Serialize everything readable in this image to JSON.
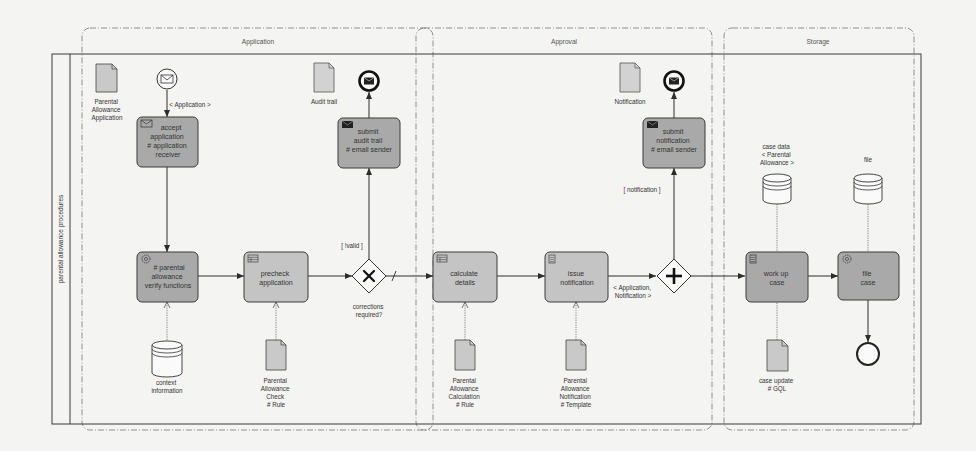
{
  "pool": {
    "label": "parental allowance procedures"
  },
  "groups": [
    {
      "id": "application",
      "label": "Application"
    },
    {
      "id": "approval",
      "label": "Approval"
    },
    {
      "id": "storage",
      "label": "Storage"
    }
  ],
  "events": {
    "start_message": {
      "label": "< Application >"
    },
    "end_audit": {
      "type": "message-end"
    },
    "end_notification": {
      "type": "message-end"
    },
    "end_file": {
      "type": "end"
    }
  },
  "tasks": {
    "accept_application": {
      "lines": [
        "accept",
        "application",
        "# application",
        "receiver"
      ],
      "icon": "envelope-icon",
      "shade": "dark"
    },
    "verify_functions": {
      "lines": [
        "# parental",
        "allowance",
        "verify functions"
      ],
      "icon": "gear-icon",
      "shade": "dark"
    },
    "precheck_application": {
      "lines": [
        "precheck",
        "application"
      ],
      "icon": "table-icon",
      "shade": "light"
    },
    "submit_audit_trail": {
      "lines": [
        "submit",
        "audit trail",
        "# email sender"
      ],
      "icon": "envelope-filled-icon",
      "shade": "dark"
    },
    "calculate_details": {
      "lines": [
        "calculate",
        "details"
      ],
      "icon": "table-icon",
      "shade": "light"
    },
    "issue_notification": {
      "lines": [
        "issue",
        "notification"
      ],
      "icon": "script-icon",
      "shade": "light"
    },
    "submit_notification": {
      "lines": [
        "submit",
        "notification",
        "# email sender"
      ],
      "icon": "envelope-filled-icon",
      "shade": "dark"
    },
    "work_up_case": {
      "lines": [
        "work up",
        "case"
      ],
      "icon": "script-icon",
      "shade": "dark"
    },
    "file_case": {
      "lines": [
        "file",
        "case"
      ],
      "icon": "gear-icon",
      "shade": "dark"
    }
  },
  "gateways": {
    "corrections": {
      "type": "exclusive",
      "label": "corrections required?",
      "lines": [
        "corrections",
        "required?"
      ]
    },
    "parallel": {
      "type": "parallel"
    }
  },
  "data_objects": {
    "parental_allowance_application": {
      "lines": [
        "Parental",
        "Allowance",
        "Application"
      ]
    },
    "audit_trail": {
      "lines": [
        "Audit trail"
      ]
    },
    "notification": {
      "lines": [
        "Notification"
      ]
    },
    "pa_check_rule": {
      "lines": [
        "Parental",
        "Allowance",
        "Check",
        "# Rule"
      ]
    },
    "pa_calc_rule": {
      "lines": [
        "Parental",
        "Allowance",
        "Calculation",
        "# Rule"
      ]
    },
    "pa_notif_template": {
      "lines": [
        "Parental",
        "Allowance",
        "Notification",
        "# Template"
      ]
    },
    "case_update": {
      "lines": [
        "case update",
        "# GQL"
      ]
    }
  },
  "data_stores": {
    "context_information": {
      "lines": [
        "context",
        "information"
      ]
    },
    "case_data": {
      "lines": [
        "case data",
        "< Parental",
        "Allowance >"
      ]
    },
    "file": {
      "lines": [
        "file"
      ]
    }
  },
  "flow_labels": {
    "invalid": "[ !valid ]",
    "notification": "[ notification ]",
    "application_notification": [
      "< Application,",
      "Notification >"
    ]
  },
  "colors": {
    "background": "#f4f4f2",
    "task_dark": "#a9a9a9",
    "task_light": "#c4c4c4",
    "stroke": "#3a3a3a",
    "group_dash": "#777777"
  }
}
